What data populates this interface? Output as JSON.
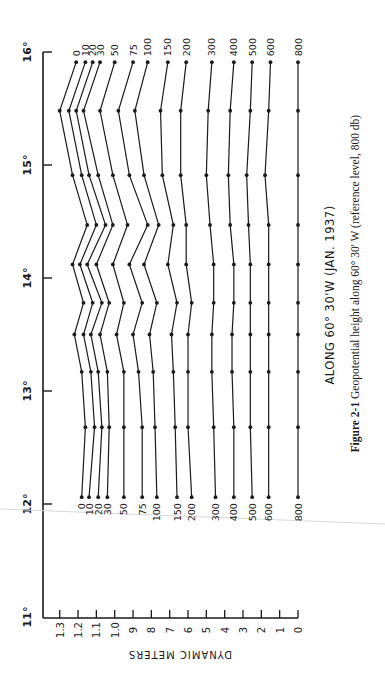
{
  "chart_data": {
    "type": "line",
    "orientation_note": "figure printed rotated 90° counter-clockwise",
    "title": "ALONG 60° 30'W (JAN. 1937)",
    "caption": {
      "label": "Figure 2-1",
      "text": "Geopotential height along 60° 30' W (reference level, 800 db)"
    },
    "xlabel": "",
    "ylabel": "DYNAMIC METERS",
    "x_axis": {
      "label": "Latitude",
      "ticks": [
        "11°",
        "12°",
        "13°",
        "14°",
        "15°",
        "16°"
      ],
      "range": [
        11,
        16
      ]
    },
    "y_axis": {
      "label": "DYNAMIC METERS",
      "ticks": [
        "0",
        ".1",
        ".2",
        ".3",
        ".4",
        ".5",
        ".6",
        ".7",
        ".8",
        ".9",
        "1.0",
        "1.1",
        "1.2",
        "1.3"
      ],
      "tick_labels_display": [
        "0",
        "1",
        "2",
        "3",
        "4",
        "5",
        "6",
        "7",
        "8",
        "9",
        "1.0",
        "1.1",
        "1.2",
        "1.3"
      ],
      "range": [
        0,
        1.3
      ]
    },
    "grid": false,
    "legend_position": "series labels at both ends of each line",
    "x": [
      12.06,
      12.68,
      13.17,
      13.5,
      13.78,
      14.12,
      14.47,
      14.91,
      15.48,
      15.91
    ],
    "series": [
      {
        "name": "0",
        "values": [
          1.18,
          1.16,
          1.18,
          1.22,
          1.17,
          1.23,
          1.15,
          1.23,
          1.3,
          1.21
        ]
      },
      {
        "name": "10",
        "values": [
          1.14,
          1.11,
          1.13,
          1.17,
          1.12,
          1.19,
          1.1,
          1.18,
          1.25,
          1.16
        ]
      },
      {
        "name": "20",
        "values": [
          1.09,
          1.07,
          1.09,
          1.13,
          1.07,
          1.15,
          1.05,
          1.14,
          1.21,
          1.12
        ]
      },
      {
        "name": "30",
        "values": [
          1.04,
          1.03,
          1.04,
          1.08,
          1.03,
          1.1,
          1.01,
          1.09,
          1.17,
          1.08
        ]
      },
      {
        "name": "50",
        "values": [
          0.95,
          0.95,
          0.95,
          0.99,
          0.95,
          1.01,
          0.93,
          1.01,
          1.08,
          1.0
        ]
      },
      {
        "name": "75",
        "values": [
          0.85,
          0.85,
          0.87,
          0.9,
          0.85,
          0.92,
          0.82,
          0.92,
          0.98,
          0.9
        ]
      },
      {
        "name": "100",
        "values": [
          0.77,
          0.78,
          0.79,
          0.81,
          0.77,
          0.84,
          0.76,
          0.84,
          0.89,
          0.82
        ]
      },
      {
        "name": "150",
        "values": [
          0.66,
          0.67,
          0.68,
          0.69,
          0.66,
          0.71,
          0.68,
          0.74,
          0.75,
          0.71
        ]
      },
      {
        "name": "200",
        "values": [
          0.58,
          0.6,
          0.6,
          0.6,
          0.58,
          0.61,
          0.61,
          0.64,
          0.64,
          0.61
        ]
      },
      {
        "name": "300",
        "values": [
          0.45,
          0.46,
          0.47,
          0.47,
          0.46,
          0.46,
          0.48,
          0.5,
          0.49,
          0.47
        ]
      },
      {
        "name": "400",
        "values": [
          0.35,
          0.35,
          0.36,
          0.36,
          0.35,
          0.35,
          0.37,
          0.38,
          0.37,
          0.35
        ]
      },
      {
        "name": "500",
        "values": [
          0.25,
          0.26,
          0.26,
          0.26,
          0.26,
          0.26,
          0.27,
          0.28,
          0.26,
          0.25
        ]
      },
      {
        "name": "600",
        "values": [
          0.16,
          0.16,
          0.16,
          0.16,
          0.16,
          0.16,
          0.16,
          0.18,
          0.16,
          0.15
        ]
      },
      {
        "name": "800",
        "values": [
          0.0,
          0.0,
          0.0,
          0.0,
          0.0,
          0.0,
          0.0,
          0.0,
          0.0,
          0.0
        ]
      }
    ]
  },
  "colors": {
    "ink": "#1a1a1a",
    "paper": "#ffffff"
  }
}
